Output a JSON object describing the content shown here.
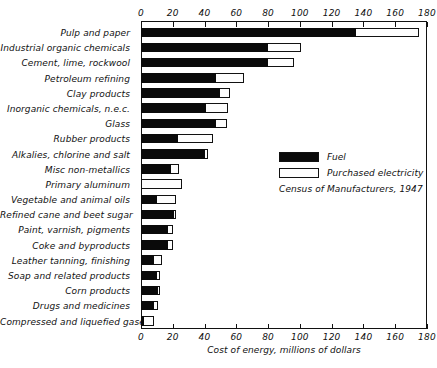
{
  "chart_data": {
    "type": "bar",
    "orientation": "horizontal",
    "stacked": true,
    "title": "",
    "xlabel": "Cost of energy, millions of dollars",
    "ylabel": "",
    "xlim": [
      0,
      180
    ],
    "xticks": [
      0,
      20,
      40,
      60,
      80,
      100,
      120,
      140,
      160,
      180
    ],
    "xtick_labels": [
      "0",
      "20",
      "40",
      "60",
      "80",
      "100",
      "120",
      "140",
      "160",
      "180"
    ],
    "grid": false,
    "legend_position": "center-right",
    "source_note": "Census of Manufacturers, 1947",
    "categories": [
      "Pulp and paper",
      "Industrial organic chemicals",
      "Cement, lime, rockwool",
      "Petroleum refining",
      "Clay products",
      "Inorganic chemicals, n.e.c.",
      "Glass",
      "Rubber products",
      "Alkalies, chlorine and salt",
      "Misc non-metallics",
      "Primary aluminum",
      "Vegetable and animal oils",
      "Refined cane and beet sugar",
      "Paint, varnish, pigments",
      "Coke and byproducts",
      "Leather tanning, finishing",
      "Soap and related products",
      "Corn products",
      "Drugs and medicines",
      "Compressed and liquefied gases"
    ],
    "series": [
      {
        "name": "Fuel",
        "color": "#0a0a0a",
        "values": [
          135,
          80,
          80,
          47,
          50,
          41,
          47,
          23,
          40,
          19,
          0,
          10,
          21,
          17,
          17,
          8,
          10,
          11,
          8,
          2
        ]
      },
      {
        "name": "Purchased electricity",
        "color": "#ffffff",
        "values": [
          40,
          21,
          16,
          18,
          6,
          14,
          7,
          22,
          2,
          5,
          26,
          12,
          1,
          3,
          3,
          5,
          2,
          1,
          3,
          6
        ]
      }
    ],
    "totals": [
      175,
      101,
      96,
      65,
      56,
      55,
      54,
      45,
      42,
      24,
      26,
      22,
      22,
      20,
      20,
      13,
      12,
      12,
      11,
      8
    ]
  },
  "legend": {
    "entries": [
      {
        "label": "Fuel",
        "swatch": "black-swatch"
      },
      {
        "label": "Purchased electricity",
        "swatch": "white-swatch"
      }
    ],
    "source": "Census of Manufacturers, 1947"
  },
  "axis": {
    "x_title": "Cost of energy, millions of dollars"
  }
}
